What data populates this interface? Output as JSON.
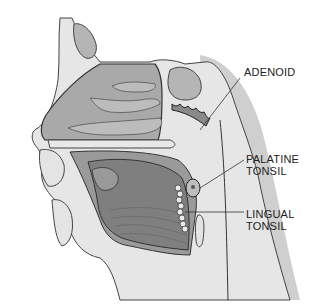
{
  "diagram": {
    "labels": [
      {
        "id": "adenoid",
        "lines": [
          "ADENOID"
        ]
      },
      {
        "id": "palatine",
        "lines": [
          "PALATINE",
          "TONSIL"
        ]
      },
      {
        "id": "lingual",
        "lines": [
          "LINGUAL",
          "TONSIL"
        ]
      }
    ]
  },
  "colors": {
    "background": "#ffffff",
    "light_tissue": "#e4e4e4",
    "mid_tissue": "#bdbdbd",
    "dark_tissue": "#8f8f8f",
    "outline": "#333333",
    "label_text": "#222222"
  }
}
